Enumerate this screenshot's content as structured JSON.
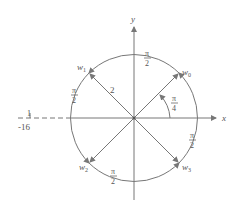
{
  "diagram": {
    "title": "",
    "axes": {
      "x_label": "x",
      "y_label": "y"
    },
    "circle_radius_label": "2",
    "tick": {
      "label": "-16",
      "numerator": "1"
    },
    "points": [
      {
        "name": "w",
        "sub": "0"
      },
      {
        "name": "w",
        "sub": "1"
      },
      {
        "name": "w",
        "sub": "2"
      },
      {
        "name": "w",
        "sub": "3"
      }
    ],
    "angle_label": {
      "num": "π",
      "den": "4"
    },
    "arc_labels": [
      {
        "num": "π",
        "den": "2"
      },
      {
        "num": "π",
        "den": "2"
      },
      {
        "num": "π",
        "den": "2"
      },
      {
        "num": "π",
        "den": "2"
      }
    ],
    "colors": {
      "line": "#777777",
      "text": "#555555"
    }
  }
}
